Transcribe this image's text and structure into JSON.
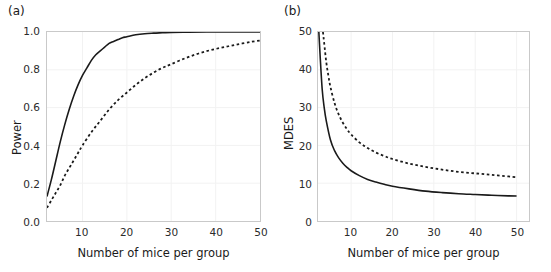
{
  "figure": {
    "background": "#ffffff",
    "axis_color": "#c9c9c9",
    "grid_color": "#f2f2f2",
    "curve_color": "#1a1a1a"
  },
  "panels": [
    {
      "label": "(a)",
      "name": "panel-a"
    },
    {
      "label": "(b)",
      "name": "panel-b"
    }
  ],
  "chart_data": [
    {
      "type": "line",
      "panel": "(a)",
      "title": "",
      "xlabel": "Number of mice per group",
      "ylabel": "Power",
      "xlim": [
        2,
        50
      ],
      "ylim": [
        0,
        1
      ],
      "xticks": [
        10,
        20,
        30,
        40,
        50
      ],
      "xticklabels": [
        "10",
        "20",
        "30",
        "40",
        "50"
      ],
      "yticks": [
        0.0,
        0.2,
        0.4,
        0.6,
        0.8,
        1.0
      ],
      "yticklabels": [
        "0.0",
        "0.2",
        "0.4",
        "0.6",
        "0.8",
        "1.0"
      ],
      "grid": true,
      "legend": "none",
      "series": [
        {
          "name": "solid-curve",
          "style": "solid",
          "x": [
            2,
            3,
            4,
            5,
            6,
            7,
            8,
            9,
            10,
            11,
            12,
            13,
            14,
            15,
            16,
            17,
            18,
            19,
            20,
            22,
            24,
            26,
            28,
            30,
            34,
            38,
            42,
            46,
            50
          ],
          "y": [
            0.13,
            0.22,
            0.32,
            0.42,
            0.51,
            0.59,
            0.66,
            0.72,
            0.77,
            0.81,
            0.85,
            0.88,
            0.9,
            0.92,
            0.94,
            0.95,
            0.96,
            0.97,
            0.975,
            0.985,
            0.991,
            0.994,
            0.996,
            0.998,
            0.999,
            1.0,
            1.0,
            1.0,
            1.0
          ]
        },
        {
          "name": "dashed-curve",
          "style": "dashed",
          "x": [
            2,
            3,
            4,
            5,
            6,
            7,
            8,
            9,
            10,
            12,
            14,
            16,
            18,
            20,
            22,
            24,
            26,
            28,
            30,
            33,
            36,
            39,
            42,
            45,
            48,
            50
          ],
          "y": [
            0.07,
            0.11,
            0.15,
            0.19,
            0.24,
            0.28,
            0.32,
            0.36,
            0.4,
            0.47,
            0.53,
            0.59,
            0.64,
            0.68,
            0.72,
            0.755,
            0.785,
            0.81,
            0.83,
            0.86,
            0.885,
            0.905,
            0.92,
            0.935,
            0.948,
            0.955
          ]
        }
      ]
    },
    {
      "type": "line",
      "panel": "(b)",
      "title": "",
      "xlabel": "Number of mice per group",
      "ylabel": "MDES",
      "xlim": [
        2,
        53
      ],
      "ylim": [
        0,
        50
      ],
      "xticks": [
        10,
        20,
        30,
        40,
        50
      ],
      "xticklabels": [
        "10",
        "20",
        "30",
        "40",
        "50"
      ],
      "yticks": [
        0,
        10,
        20,
        30,
        40,
        50
      ],
      "yticklabels": [
        "0",
        "10",
        "20",
        "30",
        "40",
        "50"
      ],
      "grid": true,
      "legend": "none",
      "series": [
        {
          "name": "solid-curve",
          "style": "solid",
          "x": [
            2.2,
            2.5,
            3,
            3.5,
            4,
            5,
            6,
            7,
            8,
            9,
            10,
            12,
            14,
            16,
            18,
            20,
            24,
            28,
            32,
            36,
            40,
            44,
            48,
            50
          ],
          "y": [
            50,
            44,
            35,
            30,
            26.5,
            21.5,
            18.6,
            16.7,
            15.3,
            14.2,
            13.3,
            12.0,
            11.0,
            10.3,
            9.7,
            9.2,
            8.5,
            7.9,
            7.5,
            7.2,
            7.0,
            6.8,
            6.65,
            6.6
          ]
        },
        {
          "name": "dashed-curve",
          "style": "dashed",
          "x": [
            3.2,
            3.5,
            4,
            4.5,
            5,
            6,
            7,
            8,
            9,
            10,
            12,
            14,
            16,
            18,
            20,
            24,
            28,
            32,
            36,
            40,
            44,
            48,
            50
          ],
          "y": [
            50,
            47,
            42,
            38.5,
            35.5,
            31.2,
            28.2,
            26.0,
            24.3,
            22.9,
            20.8,
            19.3,
            18.1,
            17.2,
            16.4,
            15.2,
            14.3,
            13.6,
            13.0,
            12.6,
            12.2,
            11.8,
            11.6
          ]
        }
      ]
    }
  ]
}
